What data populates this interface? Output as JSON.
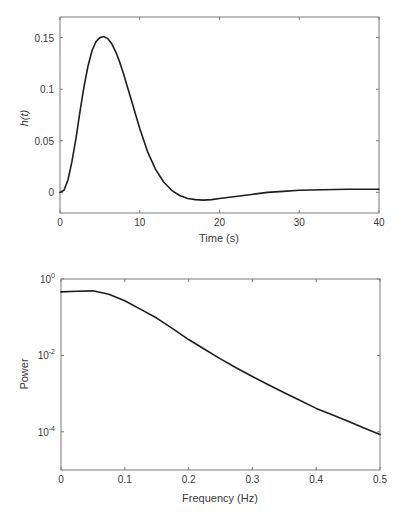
{
  "chart_data": [
    {
      "type": "line",
      "title": "",
      "xlabel": "Time (s)",
      "ylabel": "h(t)",
      "xlim": [
        0,
        40
      ],
      "ylim": [
        -0.02,
        0.17
      ],
      "xticks": [
        0,
        10,
        20,
        30,
        40
      ],
      "xtick_labels": [
        "0",
        "10",
        "20",
        "30",
        "40"
      ],
      "yticks": [
        0,
        0.05,
        0.1,
        0.15
      ],
      "ytick_labels": [
        "0",
        "0.05",
        "0.1",
        "0.15"
      ],
      "grid": false,
      "legend": null,
      "series": [
        {
          "name": "h(t)",
          "x": [
            0,
            0.5,
            1,
            1.5,
            2,
            2.5,
            3,
            3.5,
            4,
            4.5,
            5,
            5.5,
            6,
            6.5,
            7,
            7.5,
            8,
            8.5,
            9,
            9.5,
            10,
            11,
            12,
            13,
            14,
            15,
            16,
            17,
            18,
            19,
            20,
            22,
            24,
            26,
            28,
            30,
            33,
            36,
            40
          ],
          "y": [
            0,
            0.002,
            0.012,
            0.03,
            0.052,
            0.078,
            0.102,
            0.122,
            0.137,
            0.146,
            0.15,
            0.151,
            0.149,
            0.144,
            0.136,
            0.126,
            0.114,
            0.101,
            0.088,
            0.075,
            0.062,
            0.039,
            0.022,
            0.01,
            0.002,
            -0.003,
            -0.006,
            -0.007,
            -0.0075,
            -0.007,
            -0.006,
            -0.004,
            -0.002,
            0.0,
            0.001,
            0.002,
            0.0025,
            0.003,
            0.003
          ]
        }
      ]
    },
    {
      "type": "line",
      "title": "",
      "xlabel": "Frequency (Hz)",
      "ylabel": "Power",
      "yscale": "log",
      "xlim": [
        0,
        0.5
      ],
      "ylim": [
        1e-05,
        1
      ],
      "xticks": [
        0,
        0.1,
        0.2,
        0.3,
        0.4,
        0.5
      ],
      "xtick_labels": [
        "0",
        "0.1",
        "0.2",
        "0.3",
        "0.4",
        "0.5"
      ],
      "yticks": [
        1,
        0.01,
        0.0001
      ],
      "ytick_labels": [
        {
          "base": "10",
          "exp": "0"
        },
        {
          "base": "10",
          "exp": "-2"
        },
        {
          "base": "10",
          "exp": "-4"
        }
      ],
      "grid": false,
      "legend": null,
      "series": [
        {
          "name": "Power",
          "x": [
            0,
            0.025,
            0.05,
            0.075,
            0.1,
            0.125,
            0.15,
            0.175,
            0.2,
            0.225,
            0.25,
            0.275,
            0.3,
            0.325,
            0.35,
            0.375,
            0.4,
            0.425,
            0.45,
            0.475,
            0.5
          ],
          "y": [
            0.46,
            0.48,
            0.49,
            0.4,
            0.27,
            0.16,
            0.095,
            0.05,
            0.026,
            0.0145,
            0.0081,
            0.0047,
            0.0028,
            0.0017,
            0.00105,
            0.00066,
            0.00041,
            0.00028,
            0.00019,
            0.000125,
            8.5e-05
          ]
        }
      ]
    }
  ]
}
